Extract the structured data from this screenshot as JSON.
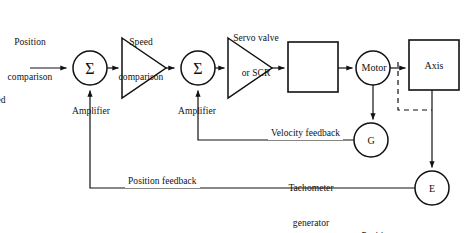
{
  "figure": {
    "type": "block-diagram",
    "background_color": "#ffffff",
    "line_color": "#111111"
  },
  "nodes": {
    "position_comparison_sum": {
      "label": "Position\ncomparison",
      "symbol": "Σ",
      "shape": "circle",
      "cx": 90,
      "cy": 68,
      "r": 17
    },
    "speed_comparison_sum": {
      "label": "Speed\ncomparison",
      "symbol": "Σ",
      "shape": "circle",
      "cx": 198,
      "cy": 68,
      "r": 17
    },
    "amplifier_1": {
      "label": "Amplifier",
      "shape": "triangle",
      "x": 122,
      "y": 38,
      "w": 44,
      "h": 60
    },
    "amplifier_2": {
      "label": "Amplifier",
      "shape": "triangle",
      "x": 228,
      "y": 38,
      "w": 44,
      "h": 60
    },
    "servo_valve": {
      "label": "Servo valve\nor SCR",
      "shape": "rect",
      "x": 288,
      "y": 42,
      "w": 50,
      "h": 50
    },
    "motor": {
      "symbol": "Motor",
      "shape": "circle",
      "cx": 373,
      "cy": 68,
      "r": 17
    },
    "axis": {
      "symbol": "Axis",
      "shape": "rect",
      "x": 409,
      "y": 40,
      "w": 50,
      "h": 50
    },
    "tachometer": {
      "symbol": "G",
      "label": "Tachometer\ngenerator",
      "shape": "circle",
      "cx": 371,
      "cy": 140,
      "r": 17
    },
    "position_measuring": {
      "symbol": "E",
      "label": "Position-\nmeasuring",
      "shape": "circle",
      "cx": 432,
      "cy": 188,
      "r": 17
    }
  },
  "labels": {
    "position_comparison_line1": "Position",
    "position_comparison_line2": "comparison",
    "speed_comparison_line1": "Speed",
    "speed_comparison_line2": "comparison",
    "servo_valve_line1": "Servo valve",
    "servo_valve_line2": "or SCR",
    "amplifier_1": "Amplifier",
    "amplifier_2": "Amplifier",
    "input_line1": "Commanded",
    "input_line2": "position",
    "input_line3": "from",
    "input_line4": "controller",
    "motor": "Motor",
    "axis": "Axis",
    "tachometer_symbol": "G",
    "tachometer_line1": "Tachometer",
    "tachometer_line2": "generator",
    "position_measuring_symbol": "E",
    "position_measuring_line1": "Position-",
    "position_measuring_line2": "measuring",
    "velocity_feedback": "Velocity feedback",
    "position_feedback": "Position feedback",
    "sigma": "Σ"
  },
  "signal_paths": [
    {
      "name": "commanded-input",
      "from": "controller input",
      "to": "position_comparison_sum",
      "style": "solid",
      "arrow": true
    },
    {
      "name": "sum1-to-amplifier1",
      "from": "position_comparison_sum",
      "to": "amplifier_1",
      "style": "solid",
      "arrow": true
    },
    {
      "name": "amplifier1-to-sum2",
      "from": "amplifier_1",
      "to": "speed_comparison_sum",
      "style": "solid",
      "arrow": true
    },
    {
      "name": "sum2-to-amplifier2",
      "from": "speed_comparison_sum",
      "to": "amplifier_2",
      "style": "solid",
      "arrow": true
    },
    {
      "name": "amplifier2-to-servo-valve",
      "from": "amplifier_2",
      "to": "servo_valve",
      "style": "solid",
      "arrow": true
    },
    {
      "name": "servo-valve-to-motor",
      "from": "servo_valve",
      "to": "motor",
      "style": "solid",
      "arrow": true
    },
    {
      "name": "motor-to-axis",
      "from": "motor",
      "to": "axis",
      "style": "solid",
      "arrow": true
    },
    {
      "name": "motor-to-tachometer",
      "from": "motor",
      "to": "tachometer",
      "style": "solid",
      "arrow": true
    },
    {
      "name": "motor-axis-coupling",
      "from": "motor",
      "to": "position_measuring",
      "style": "dashed",
      "arrow": false
    },
    {
      "name": "axis-to-position-measuring",
      "from": "axis",
      "to": "position_measuring",
      "style": "solid",
      "arrow": true
    },
    {
      "name": "velocity-feedback-path",
      "from": "tachometer",
      "to": "speed_comparison_sum",
      "style": "solid",
      "arrow": true
    },
    {
      "name": "position-feedback-path",
      "from": "position_measuring",
      "to": "position_comparison_sum",
      "style": "solid",
      "arrow": true
    }
  ]
}
